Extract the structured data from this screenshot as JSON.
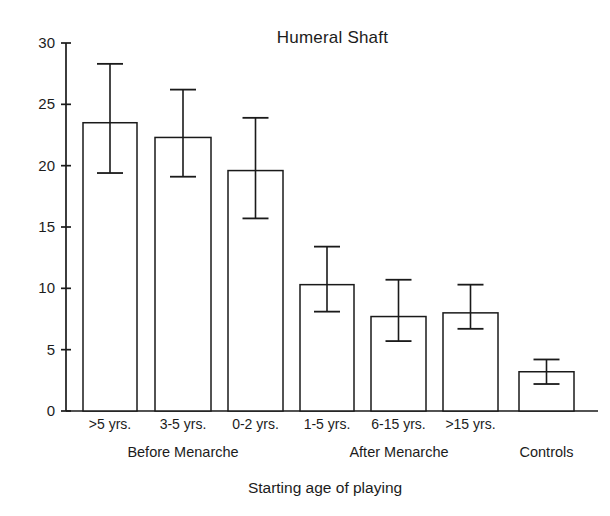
{
  "chart_data": {
    "type": "bar",
    "title": "Humeral Shaft",
    "xlabel": "Starting age of playing",
    "ylabel": "",
    "categories": [
      ">5 yrs.",
      "3-5 yrs.",
      "0-2 yrs.",
      "1-5 yrs.",
      "6-15 yrs.",
      ">15 yrs.",
      ""
    ],
    "values": [
      23.5,
      22.3,
      19.6,
      10.3,
      7.7,
      8.0,
      3.2
    ],
    "error_upper": [
      28.3,
      26.2,
      23.9,
      13.4,
      10.7,
      10.3,
      4.2
    ],
    "error_lower": [
      19.4,
      19.1,
      15.7,
      8.1,
      5.7,
      6.7,
      2.2
    ],
    "ylim": [
      0,
      30
    ],
    "yticks": [
      0,
      5,
      10,
      15,
      20,
      25,
      30
    ],
    "ytick_labels": [
      "0",
      "5",
      "10",
      "15",
      "20",
      "25",
      "30"
    ],
    "grid": false,
    "legend": "none",
    "bar_fill": "#ffffff",
    "bar_stroke": "#1a1a1a",
    "axis_color": "#1a1a1a",
    "groups": [
      {
        "label": "Before Menarche",
        "members": [
          0,
          1,
          2
        ]
      },
      {
        "label": "After Menarche",
        "members": [
          3,
          4,
          5
        ]
      },
      {
        "label": "Controls",
        "members": [
          6
        ]
      }
    ]
  },
  "axes": {
    "y_axis_name": "y-axis",
    "x_axis_name": "x-axis"
  }
}
